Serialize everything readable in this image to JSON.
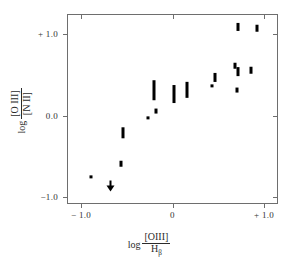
{
  "figure": {
    "background": "#ffffff",
    "marker_color": "#000000",
    "axis_color": "#6e6e6e"
  },
  "axes": {
    "x": {
      "label_log": "log",
      "label_numerator": "[OIII]",
      "label_denominator": "H",
      "label_denominator_sub": "β",
      "ticks": [
        {
          "value": -1.0,
          "label": "− 1.0"
        },
        {
          "value": 0.0,
          "label": "0"
        },
        {
          "value": 1.0,
          "label": "+ 1.0"
        }
      ],
      "range": [
        -1.2,
        1.15
      ]
    },
    "y": {
      "label_log": "log",
      "label_numerator": "[O III]",
      "label_denominator": "[N II]",
      "ticks": [
        {
          "value": 1.0,
          "label": "+ 1.0"
        },
        {
          "value": 0.0,
          "label": "0.0"
        },
        {
          "value": -1.0,
          "label": "−1.0"
        }
      ],
      "range": [
        -1.12,
        1.21
      ]
    }
  },
  "chart_data": {
    "type": "scatter",
    "title": "",
    "xlabel": "log [OIII]/Hβ",
    "ylabel": "log [O III]/[N II]",
    "xlim": [
      -1.2,
      1.15
    ],
    "ylim": [
      -1.12,
      1.21
    ],
    "grid": false,
    "legend": "none",
    "error_bars": "vertical",
    "points": [
      {
        "x": -0.9,
        "y": -0.74,
        "yerr": 0.02,
        "type": "point"
      },
      {
        "x": -0.69,
        "y": -0.85,
        "yerr": 0.05,
        "type": "upper-limit"
      },
      {
        "x": -0.57,
        "y": -0.58,
        "yerr": 0.04,
        "type": "point"
      },
      {
        "x": -0.55,
        "y": -0.2,
        "yerr": 0.07,
        "type": "point"
      },
      {
        "x": -0.28,
        "y": -0.02,
        "yerr": 0.02,
        "type": "point"
      },
      {
        "x": -0.19,
        "y": 0.07,
        "yerr": 0.03,
        "type": "point"
      },
      {
        "x": -0.21,
        "y": 0.32,
        "yerr": 0.12,
        "type": "point"
      },
      {
        "x": 0.0,
        "y": 0.27,
        "yerr": 0.11,
        "type": "point"
      },
      {
        "x": 0.15,
        "y": 0.33,
        "yerr": 0.1,
        "type": "point"
      },
      {
        "x": 0.42,
        "y": 0.38,
        "yerr": 0.02,
        "type": "point"
      },
      {
        "x": 0.45,
        "y": 0.48,
        "yerr": 0.05,
        "type": "point"
      },
      {
        "x": 0.67,
        "y": 0.62,
        "yerr": 0.04,
        "type": "point"
      },
      {
        "x": 0.7,
        "y": 0.55,
        "yerr": 0.06,
        "type": "point"
      },
      {
        "x": 0.69,
        "y": 0.32,
        "yerr": 0.03,
        "type": "point"
      },
      {
        "x": 0.85,
        "y": 0.57,
        "yerr": 0.04,
        "type": "point"
      },
      {
        "x": 0.71,
        "y": 1.1,
        "yerr": 0.05,
        "type": "point"
      },
      {
        "x": 0.91,
        "y": 1.08,
        "yerr": 0.04,
        "type": "point"
      }
    ]
  }
}
